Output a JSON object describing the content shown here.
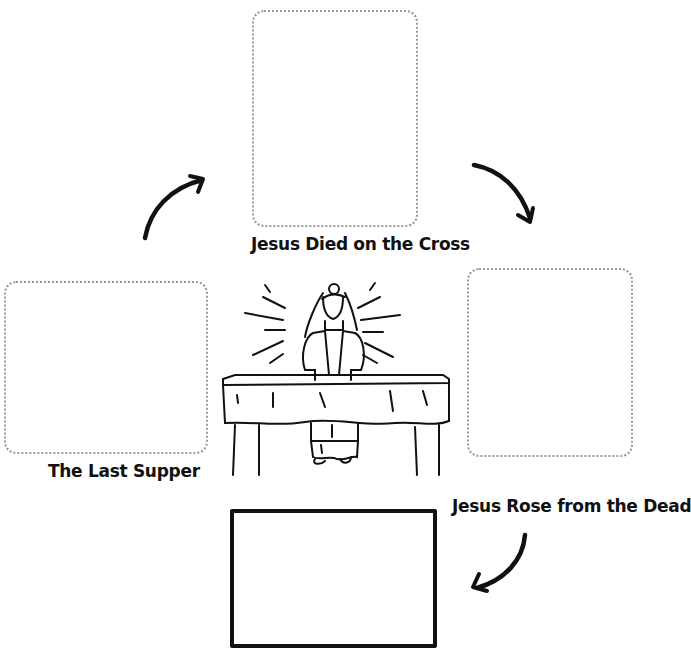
{
  "diagram": {
    "type": "cycle",
    "steps": [
      {
        "id": "last-supper",
        "label": "The Last Supper"
      },
      {
        "id": "died",
        "label": "Jesus Died on the Cross"
      },
      {
        "id": "rose",
        "label": "Jesus Rose from the Dead"
      },
      {
        "id": "blank",
        "label": ""
      }
    ],
    "center_image": "priest-at-altar-illustration",
    "arrows": [
      "last-supper-to-died",
      "died-to-rose",
      "rose-to-blank"
    ]
  }
}
